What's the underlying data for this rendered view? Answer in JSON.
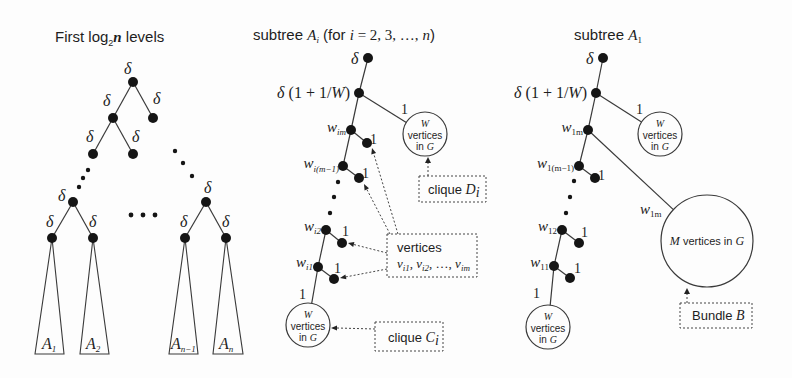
{
  "diagram": {
    "colors": {
      "background": "#fdfdfd",
      "stroke": "#3a3a3a",
      "node": "#151515"
    },
    "left_panel": {
      "title": {
        "prefix": "First log",
        "sub": "2",
        "var": "n",
        "suffix": " levels"
      },
      "edge_weight": "δ",
      "subtrees": [
        {
          "name": "A",
          "sub": "1"
        },
        {
          "name": "A",
          "sub": "2"
        },
        {
          "name": "A",
          "sub": "n−1"
        },
        {
          "name": "A",
          "sub": "n"
        }
      ]
    },
    "middle_panel": {
      "title": {
        "prefix": "subtree ",
        "var": "A",
        "sub": "i",
        "open": " (for ",
        "i": "i",
        "eq": " = 2, 3, …, ",
        "n": "n",
        "close": ")"
      },
      "root_weight": "δ",
      "second_weight": {
        "delta": "δ",
        "mid": " (1 + 1/",
        "W": "W",
        "close": ")"
      },
      "clique_d_edge_weight": "1",
      "clique_d_circle": {
        "W": "W",
        "line2": "vertices",
        "line3": "in ",
        "G": "G"
      },
      "chain": [
        {
          "w": "w",
          "sub": "im",
          "branch_weight": "1"
        },
        {
          "w": "w",
          "sub": "i(m−1)",
          "branch_weight": "1"
        },
        {
          "w": "w",
          "sub": "i2",
          "branch_weight": "1"
        },
        {
          "w": "w",
          "sub": "i1",
          "branch_weight": "1"
        }
      ],
      "clique_c_edge_weight": "1",
      "clique_c_circle": {
        "W": "W",
        "line2": "vertices",
        "line3": "in ",
        "G": "G"
      },
      "callouts": {
        "clique_d": {
          "text": "clique ",
          "var": "D",
          "sub": "i"
        },
        "vertices": {
          "line1": "vertices",
          "v": "v",
          "s1": "i1",
          "sep1": ", ",
          "s2": "i2",
          "sep2": ", …, ",
          "s3": "im"
        },
        "clique_c": {
          "text": "clique ",
          "var": "C",
          "sub": "i"
        }
      }
    },
    "right_panel": {
      "title": {
        "prefix": "subtree ",
        "var": "A",
        "sub": "1"
      },
      "root_weight": "δ",
      "second_weight": {
        "delta": "δ",
        "mid": " (1 + 1/",
        "W": "W",
        "close": ")"
      },
      "clique_d_edge_weight": "1",
      "clique_d_circle": {
        "W": "W",
        "line2": "vertices",
        "line3": "in ",
        "G": "G"
      },
      "chain": [
        {
          "w": "w",
          "sub": "1m",
          "branch_weight": ""
        },
        {
          "w": "w",
          "sub": "1(m−1)",
          "branch_weight": "1"
        },
        {
          "w": "w",
          "sub": "12",
          "branch_weight": "1"
        },
        {
          "w": "w",
          "sub": "11",
          "branch_weight": "1"
        }
      ],
      "bundle_edge_weight": {
        "w": "w",
        "sub": "1m"
      },
      "bundle_circle": {
        "M": "M",
        "text": " vertices in ",
        "G": "G"
      },
      "clique_c_edge_weight": "1",
      "clique_c_circle": {
        "W": "W",
        "line2": "vertices",
        "line3": "in ",
        "G": "G"
      },
      "callouts": {
        "bundle": {
          "text": "Bundle ",
          "var": "B"
        }
      }
    }
  }
}
